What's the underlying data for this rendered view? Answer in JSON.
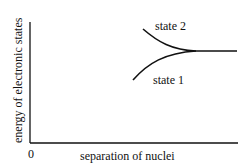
{
  "diagram": {
    "y_axis_label": "energy of electronic states",
    "x_axis_label": "separation of nuclei",
    "origin_label": "0",
    "curves": [
      {
        "name": "state 2",
        "label": "state 2",
        "description": "descends from upper left and merges with state 1"
      },
      {
        "name": "state 1",
        "label": "state 1",
        "description": "rises from lower left and merges with state 2"
      }
    ],
    "colors": {
      "line": "#111111",
      "background": "#ffffff"
    }
  }
}
